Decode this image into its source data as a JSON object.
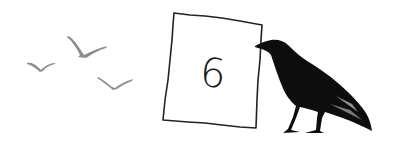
{
  "illustration": {
    "description": "Hand-drawn scene: three gulls flying, a paper sign with a number, and a black crow",
    "sign": {
      "number": "6"
    },
    "birds": [
      {
        "name": "left-gull",
        "color": "#8a8a8a"
      },
      {
        "name": "top-gull",
        "color": "#8a8a8a"
      },
      {
        "name": "right-gull",
        "color": "#8a8a8a"
      }
    ],
    "crow": {
      "color": "#0d0d0d"
    },
    "colors": {
      "background": "#ffffff",
      "sign_border": "#222222",
      "ink": "#1a1a1a"
    }
  }
}
